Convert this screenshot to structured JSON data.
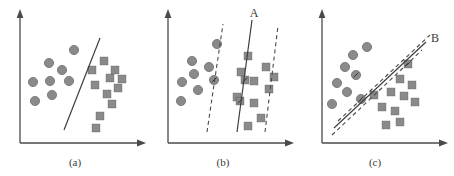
{
  "figure": {
    "title": "",
    "background": "#ffffff",
    "width": 454,
    "height": 176,
    "colors": {
      "marker": "#8a8a8a",
      "marker_edge": "#6e6e6e",
      "axis": "#4a4a4a",
      "line": "#3f3f3f",
      "dashed": "#5a5a5a",
      "text": "#3a3a3a"
    }
  },
  "panels": [
    {
      "id": "panel-a",
      "caption": "(a)",
      "line_label": "",
      "decision_boundary": {
        "x1": 64,
        "y1": 118,
        "x2": 104,
        "y2": 42
      },
      "margins": [],
      "circles": [
        {
          "cx": 33,
          "cy": 82
        },
        {
          "cx": 35,
          "cy": 101
        },
        {
          "cx": 49,
          "cy": 63
        },
        {
          "cx": 50,
          "cy": 81
        },
        {
          "cx": 52,
          "cy": 95
        },
        {
          "cx": 62,
          "cy": 70
        },
        {
          "cx": 69,
          "cy": 81
        },
        {
          "cx": 74,
          "cy": 50
        }
      ],
      "squares": [
        {
          "cx": 95,
          "cy": 85
        },
        {
          "cx": 92,
          "cy": 70
        },
        {
          "cx": 104,
          "cy": 61
        },
        {
          "cx": 107,
          "cy": 94
        },
        {
          "cx": 110,
          "cy": 78
        },
        {
          "cx": 112,
          "cy": 104
        },
        {
          "cx": 115,
          "cy": 70
        },
        {
          "cx": 118,
          "cy": 88
        },
        {
          "cx": 100,
          "cy": 116
        },
        {
          "cx": 96,
          "cy": 128
        },
        {
          "cx": 122,
          "cy": 79
        }
      ],
      "support_vectors": []
    },
    {
      "id": "panel-b",
      "caption": "(b)",
      "line_label": "A",
      "label_pos": {
        "x": 110,
        "y": 14
      },
      "decision_boundary": {
        "x1": 91,
        "y1": 130,
        "x2": 105,
        "y2": 22
      },
      "margins": [
        {
          "x1": 60,
          "y1": 130,
          "x2": 76,
          "y2": 26
        },
        {
          "x1": 116,
          "y1": 130,
          "x2": 129,
          "y2": 28
        }
      ],
      "circles": [
        {
          "cx": 34,
          "cy": 82
        },
        {
          "cx": 33,
          "cy": 101
        },
        {
          "cx": 46,
          "cy": 74
        },
        {
          "cx": 44,
          "cy": 61
        },
        {
          "cx": 50,
          "cy": 90
        },
        {
          "cx": 61,
          "cy": 67
        },
        {
          "cx": 69,
          "cy": 44
        },
        {
          "cx": 66,
          "cy": 80
        }
      ],
      "squares": [
        {
          "cx": 100,
          "cy": 56
        },
        {
          "cx": 93,
          "cy": 72
        },
        {
          "cx": 106,
          "cy": 81
        },
        {
          "cx": 89,
          "cy": 97
        },
        {
          "cx": 106,
          "cy": 103
        },
        {
          "cx": 118,
          "cy": 67
        },
        {
          "cx": 121,
          "cy": 89
        },
        {
          "cx": 113,
          "cy": 118
        },
        {
          "cx": 100,
          "cy": 126
        },
        {
          "cx": 126,
          "cy": 77
        },
        {
          "cx": 97,
          "cy": 89
        }
      ],
      "support_vectors": [
        {
          "cx": 66,
          "cy": 80,
          "shape": "circle"
        },
        {
          "cx": 97,
          "cy": 80,
          "shape": "square"
        },
        {
          "cx": 92,
          "cy": 101,
          "shape": "square"
        }
      ]
    },
    {
      "id": "panel-c",
      "caption": "(c)",
      "line_label": "B",
      "label_pos": {
        "x": 128,
        "y": 40
      },
      "decision_boundary": {
        "x1": 36,
        "y1": 126,
        "x2": 123,
        "y2": 45
      },
      "margins": [
        {
          "x1": 33,
          "y1": 133,
          "x2": 119,
          "y2": 52
        },
        {
          "x1": 40,
          "y1": 119,
          "x2": 127,
          "y2": 38
        }
      ],
      "circles": [
        {
          "cx": 37,
          "cy": 83
        },
        {
          "cx": 32,
          "cy": 104
        },
        {
          "cx": 45,
          "cy": 67
        },
        {
          "cx": 47,
          "cy": 92
        },
        {
          "cx": 53,
          "cy": 55
        },
        {
          "cx": 56,
          "cy": 75
        },
        {
          "cx": 67,
          "cy": 47
        },
        {
          "cx": 61,
          "cy": 99
        }
      ],
      "squares": [
        {
          "cx": 100,
          "cy": 79
        },
        {
          "cx": 91,
          "cy": 92
        },
        {
          "cx": 82,
          "cy": 107
        },
        {
          "cx": 104,
          "cy": 96
        },
        {
          "cx": 95,
          "cy": 111
        },
        {
          "cx": 112,
          "cy": 85
        },
        {
          "cx": 115,
          "cy": 102
        },
        {
          "cx": 86,
          "cy": 125
        },
        {
          "cx": 100,
          "cy": 122
        },
        {
          "cx": 108,
          "cy": 64
        },
        {
          "cx": 74,
          "cy": 95
        }
      ],
      "support_vectors": [
        {
          "cx": 56,
          "cy": 75,
          "shape": "circle"
        },
        {
          "cx": 61,
          "cy": 99,
          "shape": "circle"
        },
        {
          "cx": 108,
          "cy": 64,
          "shape": "square"
        }
      ]
    }
  ],
  "axes": {
    "y_axis": {
      "x": 20,
      "y_top": 12,
      "y_bottom": 143
    },
    "x_axis": {
      "y": 143,
      "x_left": 20,
      "x_right": 145
    },
    "arrow_size": 5
  }
}
